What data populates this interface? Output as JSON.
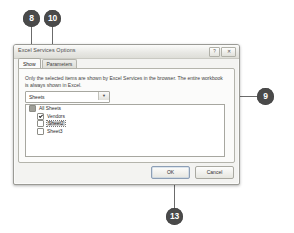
{
  "figure": {
    "background_color": "#ffffff",
    "callout_color": "#4a4a4a",
    "callout_text_color": "#ffffff"
  },
  "callouts": [
    {
      "id": "callout-8",
      "label": "8",
      "target": "show-tab"
    },
    {
      "id": "callout-10",
      "label": "10",
      "target": "parameters-tab"
    },
    {
      "id": "callout-9",
      "label": "9",
      "target": "item-type-dropdown"
    },
    {
      "id": "callout-13",
      "label": "13",
      "target": "ok-button"
    }
  ],
  "dialog": {
    "title": "Excel Services Options",
    "window_buttons": {
      "help_label": "?",
      "close_label": "✕"
    },
    "tabs": [
      {
        "label": "Show",
        "active": true
      },
      {
        "label": "Parameters",
        "active": false
      }
    ],
    "help_text": "Only the selected items are shown by Excel Services in the browser. The entire workbook is always shown in Excel.",
    "item_type": {
      "selected": "Sheets",
      "arrow_glyph": "▼",
      "options": [
        "Entire Workbook",
        "Sheets",
        "Items in the Workbook"
      ]
    },
    "sheet_list": [
      {
        "label": "All Sheets",
        "state": "mixed",
        "indent": 0,
        "selected": false
      },
      {
        "label": "Vendors",
        "state": "checked",
        "indent": 1,
        "selected": false
      },
      {
        "label": "Sheet2",
        "state": "unchecked",
        "indent": 1,
        "selected": true
      },
      {
        "label": "Sheet3",
        "state": "unchecked",
        "indent": 1,
        "selected": false
      }
    ],
    "buttons": {
      "ok_label": "OK",
      "cancel_label": "Cancel"
    }
  }
}
